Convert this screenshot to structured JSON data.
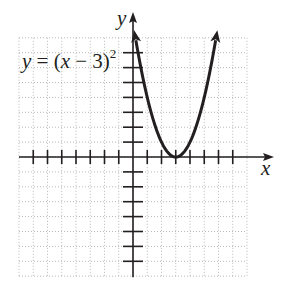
{
  "chart_data": {
    "type": "line",
    "title": "",
    "equation_label": "y = (x − 3)^2",
    "equation_parts": {
      "lhs": "y",
      "eq": " = (",
      "var": "x",
      "rest": " − 3)",
      "exp": "2"
    },
    "xlabel": "x",
    "ylabel": "y",
    "xlim": [
      -8,
      8
    ],
    "ylim": [
      -8,
      8
    ],
    "x_ticks": [
      -7,
      -6,
      -5,
      -4,
      -3,
      -2,
      -1,
      1,
      2,
      3,
      4,
      5,
      6,
      7
    ],
    "y_ticks": [
      -7,
      -6,
      -5,
      -4,
      -3,
      -2,
      -1,
      1,
      2,
      3,
      4,
      5,
      6,
      7
    ],
    "grid": true,
    "series": [
      {
        "name": "y = (x − 3)^2",
        "function": "(x-3)^2",
        "x_range": [
          0.2,
          5.8
        ],
        "arrows": "both ends",
        "points": [
          [
            0.2,
            7.84
          ],
          [
            1,
            4
          ],
          [
            2,
            1
          ],
          [
            3,
            0
          ],
          [
            4,
            1
          ],
          [
            5,
            4
          ],
          [
            5.8,
            7.84
          ]
        ]
      }
    ],
    "vertex": [
      3,
      0
    ]
  },
  "colors": {
    "ink": "#231f20",
    "grid": "#b8b8b8"
  }
}
